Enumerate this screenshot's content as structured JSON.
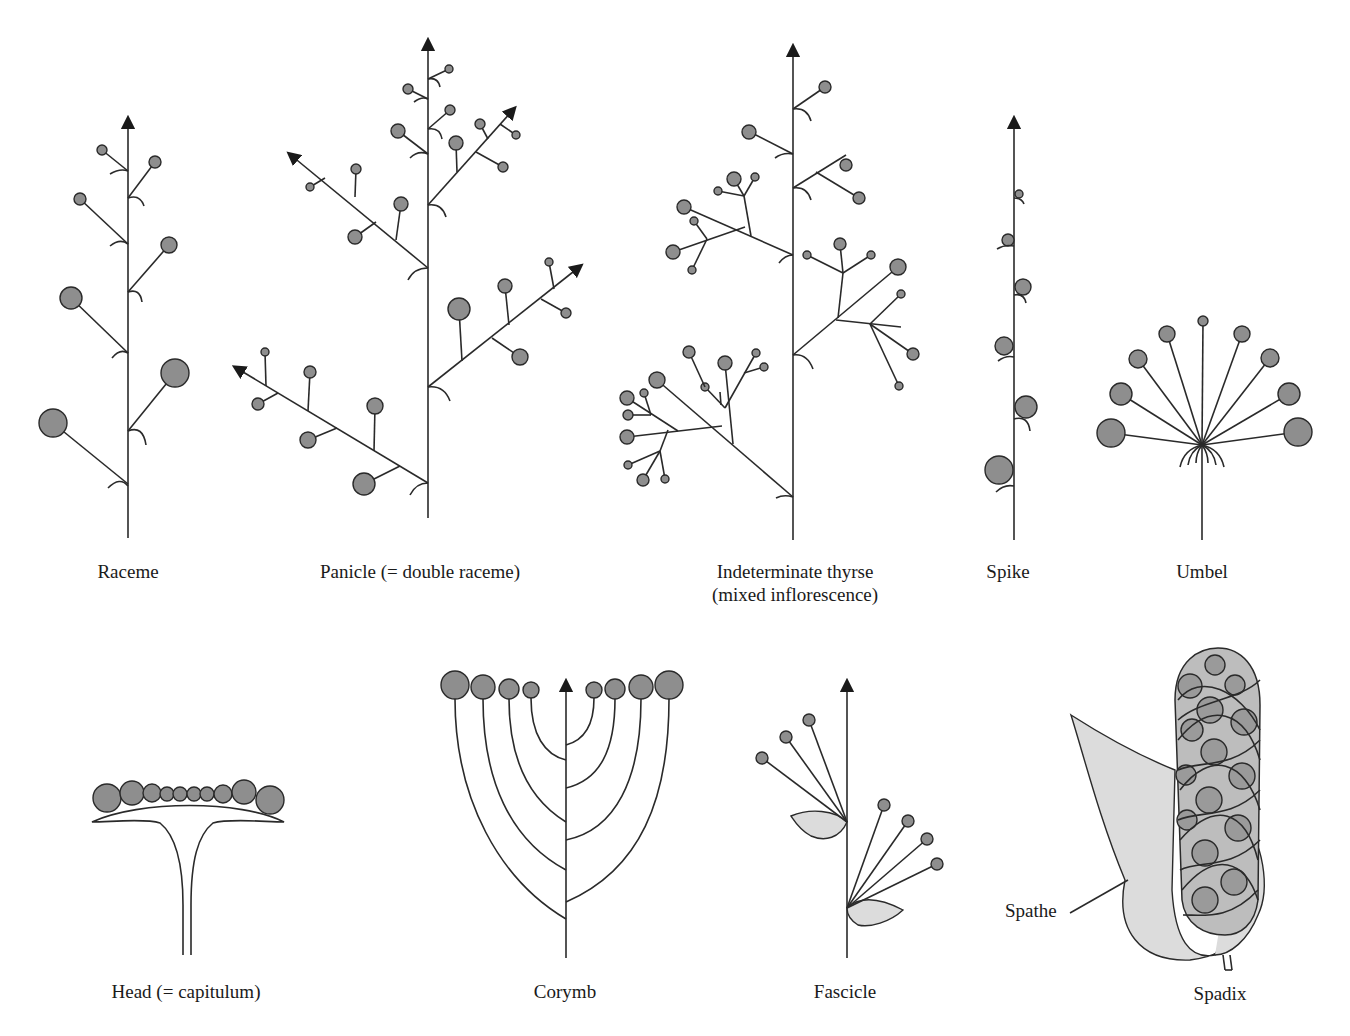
{
  "figure": {
    "colors": {
      "flower": "#8e8e8e",
      "bract_leaf": "#dcdcdc",
      "line": "#2a2a2a",
      "background": "#ffffff"
    }
  },
  "labels": {
    "raceme": "Raceme",
    "panicle": "Panicle (= double raceme)",
    "thyrse_line1": "Indeterminate thyrse",
    "thyrse_line2": "(mixed inflorescence)",
    "spike": "Spike",
    "umbel": "Umbel",
    "head": "Head (= capitulum)",
    "corymb": "Corymb",
    "fascicle": "Fascicle",
    "spadix": "Spadix",
    "spathe": "Spathe"
  }
}
